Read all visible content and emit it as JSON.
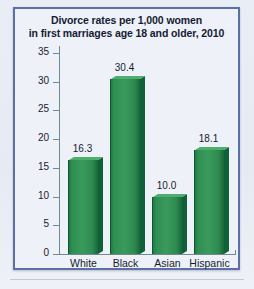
{
  "chart_data": {
    "type": "bar",
    "title": "Divorce rates per 1,000 women in first marriages age 18 and older, 2010",
    "title_line1": "Divorce rates per 1,000 women",
    "title_line2": "in first marriages age 18 and older, 2010",
    "xlabel": "",
    "ylabel": "",
    "categories": [
      "White",
      "Black",
      "Asian",
      "Hispanic"
    ],
    "values": [
      16.3,
      30.4,
      10.0,
      18.1
    ],
    "value_labels": [
      "16.3",
      "30.4",
      "10.0",
      "18.1"
    ],
    "ylim": [
      0,
      35
    ],
    "ytick_labels": [
      "35",
      "30",
      "25",
      "20",
      "15",
      "10",
      "5",
      "0"
    ],
    "ytick_values": [
      35,
      30,
      25,
      20,
      15,
      10,
      5,
      0
    ],
    "grid": false,
    "legend": false,
    "bar_color": "#2f8f52",
    "bar_color_dark": "#10603a",
    "bar_color_light": "#4fae6d",
    "axis_color": "#6f8a93",
    "panel_border_color": "#5b6fa8",
    "panel_background": "#eef1f8",
    "page_background": "#e8ecf4",
    "text_color": "#151d30"
  }
}
